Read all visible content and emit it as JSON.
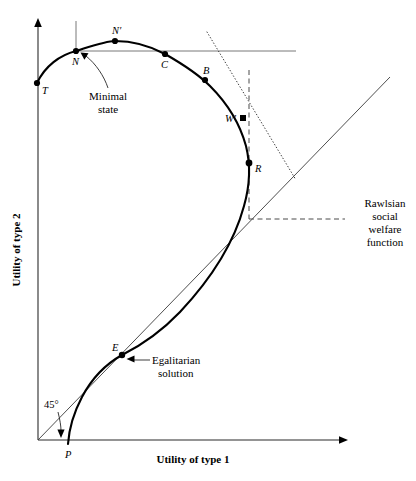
{
  "figure": {
    "title_visible": false,
    "background": "#ffffff",
    "ink": "#000000"
  },
  "axes": {
    "x_label": "Utility of type 1",
    "y_label": "Utility of type 2",
    "origin": {
      "x": 38,
      "y": 440
    },
    "x_axis_end": {
      "x": 348,
      "y": 440
    },
    "y_axis_top": {
      "x": 38,
      "y": 20
    }
  },
  "points": [
    {
      "id": "T",
      "label": "T",
      "x": 37,
      "y": 83,
      "label_dx": 5,
      "label_dy": 11
    },
    {
      "id": "N",
      "label": "N",
      "x": 76,
      "y": 51,
      "label_dx": -4,
      "label_dy": 14
    },
    {
      "id": "Nprime",
      "label": "N′",
      "x": 115,
      "y": 41,
      "label_dx": -3,
      "label_dy": -7
    },
    {
      "id": "C",
      "label": "C",
      "x": 165,
      "y": 54,
      "label_dx": -4,
      "label_dy": 14
    },
    {
      "id": "B",
      "label": "B",
      "x": 205,
      "y": 80,
      "label_dx": -2,
      "label_dy": -6
    },
    {
      "id": "Wprime",
      "label": "W′",
      "x": 243,
      "y": 118,
      "label_dx": -18,
      "label_dy": 4
    },
    {
      "id": "R",
      "label": "R",
      "x": 249,
      "y": 163,
      "label_dx": 6,
      "label_dy": 9
    },
    {
      "id": "E",
      "label": "E",
      "x": 122,
      "y": 355,
      "label_dx": -10,
      "label_dy": -4
    },
    {
      "id": "P",
      "label": "P",
      "x": 68,
      "y": 444,
      "label_dx": -3,
      "label_dy": 14
    }
  ],
  "annotations": {
    "minimal_state": {
      "lines": [
        "Minimal",
        "state"
      ],
      "x": 108,
      "y": 100
    },
    "rawlsian": {
      "lines": [
        "Rawlsian",
        "social",
        "welfare",
        "function"
      ],
      "x": 388,
      "y": 203
    },
    "egalitarian": {
      "lines": [
        "Egalitarian",
        "solution"
      ],
      "x": 152,
      "y": 360
    },
    "angle45": {
      "text": "45°",
      "x": 52,
      "y": 406
    }
  },
  "guides": {
    "horizontal_from_N": {
      "x1": 76,
      "y1": 51,
      "x2": 296,
      "y2": 51
    },
    "vertical_from_N": {
      "x1": 76,
      "y1": 21,
      "x2": 76,
      "y2": 51
    },
    "dotted_tangent": {
      "x1": 207,
      "y1": 32,
      "x2": 296,
      "y2": 180
    },
    "dashed_vertical_R": {
      "x1": 249,
      "y1": 70,
      "x2": 249,
      "y2": 219
    },
    "dashed_horizontal_R": {
      "x1": 249,
      "y1": 219,
      "x2": 345,
      "y2": 219
    },
    "ray_45_deg": {
      "x1": 38,
      "y1": 440,
      "x2": 390,
      "y2": 77
    }
  },
  "curve": {
    "description": "utility possibility frontier",
    "path": "M 37 83 C 45 66, 60 55, 76 51 C 95 45, 106 41, 115 41 C 133 41, 152 47, 165 54 C 186 66, 199 75, 210 86 C 228 104, 240 124, 246 146 C 251 166, 250 185, 244 206 C 234 243, 210 280, 180 312 C 158 335, 138 347, 122 355 C 106 364, 92 378, 82 397 C 73 414, 69 430, 68 444"
  }
}
